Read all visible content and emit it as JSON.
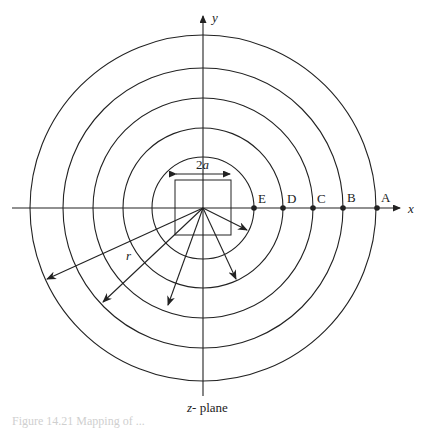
{
  "figure": {
    "axis_x_label": "x",
    "axis_y_label": "y",
    "plane_label": "z- plane",
    "width_label": "2a",
    "radius_label": "r",
    "points": [
      {
        "label": "E",
        "x": 254
      },
      {
        "label": "D",
        "x": 283
      },
      {
        "label": "C",
        "x": 313
      },
      {
        "label": "B",
        "x": 343
      },
      {
        "label": "A",
        "x": 377
      }
    ],
    "circles_radii": [
      51,
      80,
      110,
      140,
      173
    ],
    "center": [
      203,
      208
    ],
    "caption": "Figure 14.21 Mapping of ..."
  }
}
